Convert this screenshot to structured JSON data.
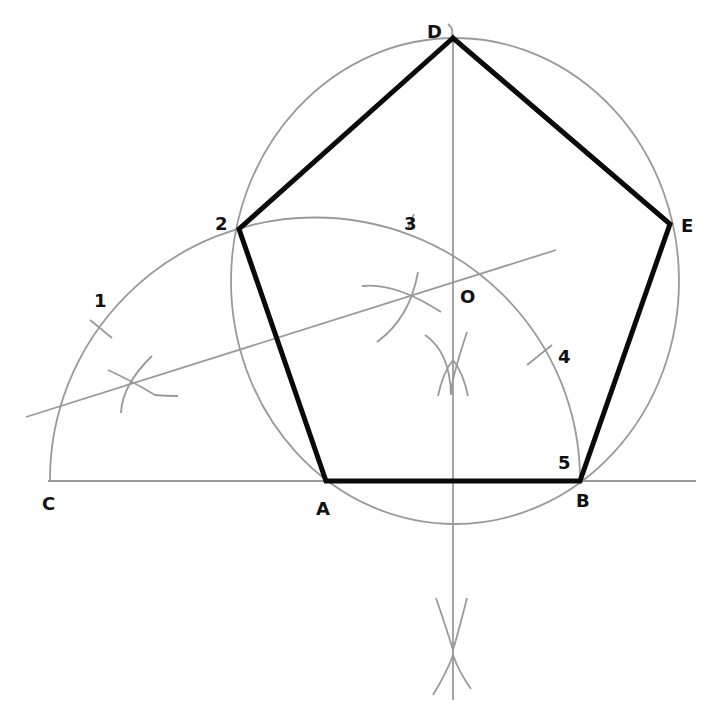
{
  "diagram": {
    "colors": {
      "construction": "#9a9a9a",
      "pentagon": "#0a0a0a",
      "label": "#111111",
      "background": "#ffffff"
    },
    "points": {
      "A": "A",
      "B": "B",
      "C": "C",
      "D": "D",
      "E": "E",
      "O": "O",
      "p1": "1",
      "p2": "2",
      "p3": "3",
      "p4": "4",
      "p5": "5"
    },
    "pentagon_vertices": [
      "A",
      "B",
      "E",
      "D",
      "2"
    ],
    "division_marks": [
      "1",
      "2",
      "3",
      "4",
      "5"
    ]
  }
}
